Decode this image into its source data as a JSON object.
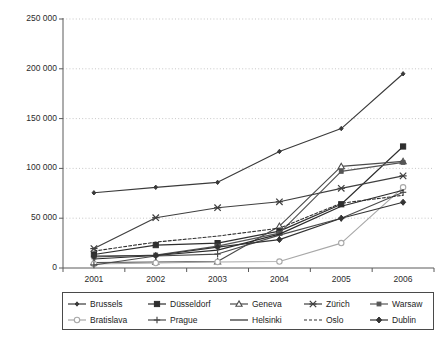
{
  "chart_data": {
    "type": "line",
    "title": "",
    "xlabel": "",
    "ylabel": "Degree",
    "categories": [
      "2001",
      "2002",
      "2003",
      "2004",
      "2005",
      "2006"
    ],
    "x": [
      2001,
      2002,
      2003,
      2004,
      2005,
      2006
    ],
    "ylim": [
      0,
      250000
    ],
    "ytick_values": [
      0,
      50000,
      100000,
      150000,
      200000,
      250000
    ],
    "ytick_labels": [
      "0",
      "50 000",
      "100 000",
      "150 000",
      "200 000",
      "250 000"
    ],
    "grid": "horizontal-dotted",
    "legend_position": "bottom",
    "legend_columns": 5,
    "series": [
      {
        "name": "Brussels",
        "marker": "diamond-small",
        "line": "solid",
        "color": "#3a3a3a",
        "values": [
          75500,
          81000,
          86000,
          117000,
          140000,
          195000
        ]
      },
      {
        "name": "Düsseldorf",
        "marker": "square-filled",
        "line": "solid",
        "color": "#2e2e2e",
        "values": [
          13500,
          23000,
          25000,
          37000,
          64000,
          122000
        ]
      },
      {
        "name": "Geneva",
        "marker": "triangle-open",
        "line": "solid",
        "color": "#4b4b4b",
        "values": [
          5500,
          6000,
          6500,
          42000,
          102000,
          107000
        ]
      },
      {
        "name": "Zürich",
        "marker": "cross",
        "line": "solid",
        "color": "#3f3f3f",
        "values": [
          19500,
          50500,
          60500,
          66500,
          80000,
          92500
        ]
      },
      {
        "name": "Warsaw",
        "marker": "square-small",
        "line": "solid",
        "color": "#555555",
        "values": [
          11000,
          13000,
          22000,
          35000,
          97000,
          106000
        ]
      },
      {
        "name": "Bratislava",
        "marker": "circle-open",
        "line": "solid",
        "color": "#a8a8a8",
        "values": [
          4000,
          5000,
          6000,
          6500,
          25000,
          81000
        ]
      },
      {
        "name": "Prague",
        "marker": "plus",
        "line": "solid",
        "color": "#4a4a4a",
        "values": [
          3000,
          12000,
          14000,
          33000,
          50000,
          76000
        ]
      },
      {
        "name": "Helsinki",
        "marker": "none",
        "line": "solid",
        "color": "#2a2a2a",
        "values": [
          9000,
          12500,
          18000,
          34000,
          62000,
          78000
        ]
      },
      {
        "name": "Oslo",
        "marker": "none",
        "line": "dashed",
        "color": "#303030",
        "values": [
          17000,
          26000,
          32000,
          40000,
          65000,
          73000
        ]
      },
      {
        "name": "Dublin",
        "marker": "diamond-filled",
        "line": "solid",
        "color": "#333333",
        "values": [
          12000,
          12500,
          21000,
          28500,
          50000,
          66000
        ]
      }
    ]
  },
  "legend": {
    "items": [
      {
        "label": "Brussels",
        "sym": "diamond-small"
      },
      {
        "label": "Düsseldorf",
        "sym": "square-filled"
      },
      {
        "label": "Geneva",
        "sym": "triangle-open"
      },
      {
        "label": "Zürich",
        "sym": "cross"
      },
      {
        "label": "Warsaw",
        "sym": "square-small"
      },
      {
        "label": "Bratislava",
        "sym": "circle-open"
      },
      {
        "label": "Prague",
        "sym": "plus"
      },
      {
        "label": "Helsinki",
        "sym": "none"
      },
      {
        "label": "Oslo",
        "sym": "dashed"
      },
      {
        "label": "Dublin",
        "sym": "diamond-filled"
      }
    ]
  }
}
